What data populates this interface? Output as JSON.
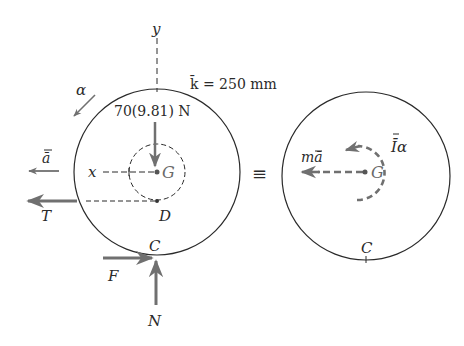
{
  "diagram": {
    "colors": {
      "outline": "#2a2a2a",
      "force": "#707070",
      "background": "#ffffff"
    },
    "fbd": {
      "axis_y_label": "y",
      "axis_x_label": "x",
      "radius_gyration_label": "k̄ = 250 mm",
      "weight_label": "70(9.81) N",
      "center_label": "G",
      "point_d_label": "D",
      "contact_label": "C",
      "alpha_label": "α",
      "accel_label": "ā",
      "tension_label": "T",
      "friction_label": "F",
      "normal_label": "N"
    },
    "equivalence_symbol": "≡",
    "kd": {
      "inertia_force_label": "mā",
      "inertia_moment_label": "Īα",
      "center_label": "G",
      "contact_label": "C"
    }
  }
}
